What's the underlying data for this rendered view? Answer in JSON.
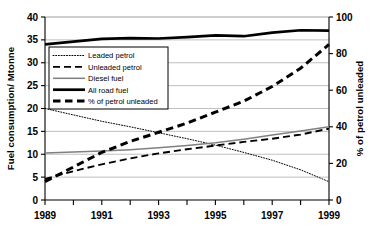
{
  "chart_data": {
    "type": "line",
    "title": "",
    "xlabel": "",
    "ylabel": "Fuel consumption/ Mtonne",
    "y2label": "% of petrol unleaded",
    "x": [
      1989,
      1990,
      1991,
      1992,
      1993,
      1994,
      1995,
      1996,
      1997,
      1998,
      1999
    ],
    "xlim": [
      1989,
      1999
    ],
    "xticks": [
      1989,
      1990,
      1991,
      1992,
      1993,
      1994,
      1995,
      1996,
      1997,
      1998,
      1999
    ],
    "xticklabels": [
      "1989",
      "",
      "1991",
      "",
      "1993",
      "",
      "1995",
      "",
      "1997",
      "",
      "1999"
    ],
    "ylim": [
      0,
      40
    ],
    "yticks": [
      0,
      5,
      10,
      15,
      20,
      25,
      30,
      35,
      40
    ],
    "yticklabels": [
      "0",
      "5",
      "10",
      "15",
      "20",
      "25",
      "30",
      "35",
      "40"
    ],
    "y2lim": [
      0,
      100
    ],
    "y2ticks": [
      0,
      20,
      40,
      60,
      80,
      100
    ],
    "y2ticklabels": [
      "0",
      "20",
      "40",
      "60",
      "80",
      "100"
    ],
    "grid": true,
    "grid_axis": "y",
    "legend_position": "upper left inside",
    "series": [
      {
        "name": "Leaded petrol",
        "axis": "left",
        "style": "dotted",
        "color": "#000000",
        "values": [
          20.0,
          18.6,
          17.2,
          16.0,
          14.7,
          13.4,
          12.0,
          10.4,
          8.7,
          6.6,
          4.0
        ]
      },
      {
        "name": "Unleaded petrol",
        "axis": "left",
        "style": "dashed",
        "color": "#000000",
        "values": [
          4.6,
          6.3,
          7.8,
          9.1,
          10.2,
          11.1,
          11.9,
          12.7,
          13.4,
          14.3,
          15.6
        ]
      },
      {
        "name": "Diesel fuel",
        "axis": "left",
        "style": "solid-thin",
        "color": "#808080",
        "values": [
          10.3,
          10.5,
          10.7,
          11.0,
          11.4,
          11.9,
          12.5,
          13.3,
          14.2,
          15.1,
          16.0
        ]
      },
      {
        "name": "All road fuel",
        "axis": "left",
        "style": "solid-thick",
        "color": "#000000",
        "values": [
          34.0,
          34.6,
          35.2,
          35.4,
          35.3,
          35.6,
          36.0,
          35.8,
          36.6,
          37.1,
          37.0
        ]
      },
      {
        "name": "% of petrol unleaded",
        "axis": "right",
        "style": "dashed-thick",
        "color": "#000000",
        "values": [
          10.0,
          18.0,
          26.0,
          32.0,
          37.0,
          42.0,
          48.0,
          54.0,
          62.0,
          72.0,
          85.0
        ]
      }
    ]
  },
  "legend": {
    "items": [
      {
        "label": "Leaded petrol"
      },
      {
        "label": "Unleaded petrol"
      },
      {
        "label": "Diesel fuel"
      },
      {
        "label": "All road fuel"
      },
      {
        "label": "% of petrol unleaded"
      }
    ]
  },
  "colors": {
    "axis": "#000000",
    "grid": "#b9b9b9",
    "diesel": "#808080",
    "background": "#ffffff"
  }
}
